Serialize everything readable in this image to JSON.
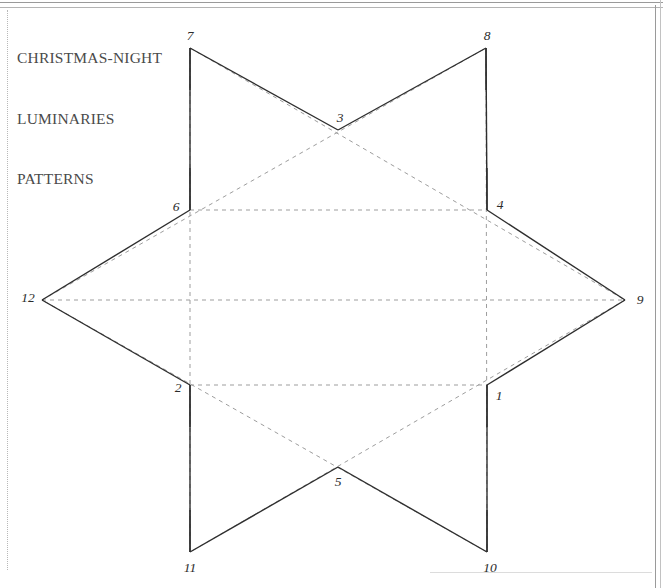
{
  "page": {
    "title_lines": [
      "CHRISTMAS-NIGHT",
      "LUMINARIES",
      "PATTERNS"
    ],
    "background_color": "#ffffff",
    "frame_rule_color": "#9a9a9a"
  },
  "figure": {
    "name": "six-pointed-star-luminary-pattern",
    "type": "hexagram",
    "solid_line_color": "#2e2e2e",
    "dashed_line_color": "#9d9d9d",
    "solid_stroke_width": 1.4,
    "dashed_stroke_width": 1.0,
    "dash_pattern": "4 4",
    "center": {
      "x": 338,
      "y": 300
    },
    "outer_radius": 283,
    "inner_radius": 171,
    "points": [
      {
        "id": "1",
        "kind": "inner",
        "x": 487,
        "y": 385,
        "label": "1",
        "label_x": 499,
        "label_y": 396
      },
      {
        "id": "2",
        "kind": "inner",
        "x": 190,
        "y": 385,
        "label": "2",
        "label_x": 178,
        "label_y": 388
      },
      {
        "id": "3",
        "kind": "inner",
        "x": 338,
        "y": 130,
        "label": "3",
        "label_x": 340,
        "label_y": 118
      },
      {
        "id": "4",
        "kind": "inner",
        "x": 487,
        "y": 210,
        "label": "4",
        "label_x": 500,
        "label_y": 205
      },
      {
        "id": "5",
        "kind": "inner",
        "x": 338,
        "y": 467,
        "label": "5",
        "label_x": 338,
        "label_y": 482
      },
      {
        "id": "6",
        "kind": "inner",
        "x": 190,
        "y": 210,
        "label": "6",
        "label_x": 176,
        "label_y": 207
      },
      {
        "id": "7",
        "kind": "outer",
        "x": 190,
        "y": 48,
        "label": "7",
        "label_x": 190,
        "label_y": 36
      },
      {
        "id": "8",
        "kind": "outer",
        "x": 486,
        "y": 48,
        "label": "8",
        "label_x": 487,
        "label_y": 36
      },
      {
        "id": "9",
        "kind": "outer",
        "x": 625,
        "y": 300,
        "label": "9",
        "label_x": 640,
        "label_y": 300
      },
      {
        "id": "10",
        "kind": "outer",
        "x": 487,
        "y": 552,
        "label": "10",
        "label_x": 490,
        "label_y": 568
      },
      {
        "id": "11",
        "kind": "outer",
        "x": 190,
        "y": 552,
        "label": "11",
        "label_x": 190,
        "label_y": 568
      },
      {
        "id": "12",
        "kind": "outer",
        "x": 42,
        "y": 300,
        "label": "12",
        "label_x": 28,
        "label_y": 298
      }
    ],
    "solid_outline_order": [
      "7",
      "3",
      "8",
      "4",
      "9",
      "1",
      "10",
      "5",
      "11",
      "2",
      "12",
      "6"
    ],
    "dashed_triangle_a": [
      "7",
      "9",
      "11"
    ],
    "dashed_triangle_b": [
      "8",
      "10",
      "12"
    ],
    "dashed_inner_chords": [
      [
        "6",
        "4"
      ],
      [
        "2",
        "1"
      ],
      [
        "12",
        "9"
      ]
    ],
    "fold_tabs": [
      {
        "at": "6",
        "x": 190,
        "y": 210,
        "to_y": 168
      },
      {
        "at": "4",
        "x": 487,
        "y": 210,
        "to_y": 168
      },
      {
        "at": "2",
        "x": 190,
        "y": 385,
        "to_y": 427
      },
      {
        "at": "1",
        "x": 487,
        "y": 385,
        "to_y": 427
      },
      {
        "at": "7",
        "x": 190,
        "y": 48,
        "to_y": 90
      },
      {
        "at": "8",
        "x": 486,
        "y": 48,
        "to_y": 90
      },
      {
        "at": "11",
        "x": 190,
        "y": 552,
        "to_y": 510
      },
      {
        "at": "10",
        "x": 487,
        "y": 552,
        "to_y": 510
      }
    ]
  }
}
